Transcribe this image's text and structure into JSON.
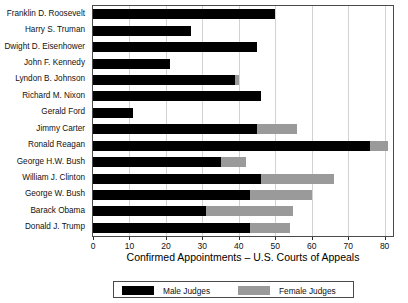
{
  "chart_data": {
    "type": "bar",
    "orientation": "horizontal",
    "stacked": true,
    "title": "",
    "subtitle": "",
    "xlabel": "Confirmed Appointments – U.S. Courts of Appeals",
    "ylabel": "",
    "xlim": [
      0,
      82.3
    ],
    "ylim": [],
    "xticks": [
      0,
      10,
      20,
      30,
      40,
      50,
      60,
      70,
      80
    ],
    "xticklabels": [
      "0",
      "10",
      "20",
      "30",
      "40",
      "50",
      "60",
      "70",
      "80"
    ],
    "grid": "vertical",
    "legend_position": "bottom",
    "categories": [
      "Franklin D. Roosevelt",
      "Harry S. Truman",
      "Dwight D. Eisenhower",
      "John F. Kennedy",
      "Lyndon B. Johnson",
      "Richard M. Nixon",
      "Gerald Ford",
      "Jimmy Carter",
      "Ronald Reagan",
      "George H.W. Bush",
      "William J. Clinton",
      "George W. Bush",
      "Barack Obama",
      "Donald J. Trump"
    ],
    "series": [
      {
        "name": "Male Judges",
        "color": "#000000",
        "values": [
          50,
          27,
          45,
          21,
          39,
          46,
          11,
          45,
          76,
          35,
          46,
          43,
          31,
          43
        ]
      },
      {
        "name": "Female Judges",
        "color": "#9a9a9a",
        "values": [
          0,
          0,
          0,
          0,
          1,
          0,
          0,
          11,
          5,
          7,
          20,
          17,
          24,
          11
        ]
      }
    ],
    "totals": [
      50,
      27,
      45,
      21,
      40,
      46,
      11,
      56,
      81,
      42,
      66,
      60,
      55,
      54
    ]
  },
  "legend": {
    "entries": [
      {
        "label": "Male Judges",
        "color": "#000000"
      },
      {
        "label": "Female Judges",
        "color": "#9a9a9a"
      }
    ]
  },
  "axis": {
    "x_title": "Confirmed Appointments – U.S. Courts of Appeals"
  }
}
